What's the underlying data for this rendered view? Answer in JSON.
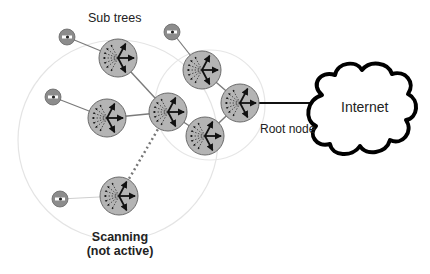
{
  "labels": {
    "subtrees": "Sub trees",
    "root_node": "Root node",
    "internet": "Internet",
    "scanning_line1": "Scanning",
    "scanning_line2": "(not active)"
  },
  "colors": {
    "node_fill": "#b4b4b4",
    "node_stroke": "#6a6a6a",
    "gateway_fill": "#8c8c8c",
    "link": "#7a7a7a",
    "coverage": "#e2e2e2",
    "arrow": "#111111",
    "cloud_stroke": "#000000"
  },
  "nodes": [
    {
      "id": "subtree-top",
      "role": "mesh-node"
    },
    {
      "id": "subtree-left",
      "role": "mesh-node"
    },
    {
      "id": "center",
      "role": "mesh-node"
    },
    {
      "id": "top-right",
      "role": "mesh-node"
    },
    {
      "id": "root",
      "role": "root-node"
    },
    {
      "id": "lower-right",
      "role": "mesh-node"
    },
    {
      "id": "scanning",
      "role": "scanning-node"
    }
  ],
  "gateways": [
    {
      "id": "gw-1",
      "attached_to": "subtree-top"
    },
    {
      "id": "gw-2",
      "attached_to": "top-right"
    },
    {
      "id": "gw-3",
      "attached_to": "subtree-left"
    },
    {
      "id": "gw-4",
      "attached_to": "scanning"
    }
  ],
  "links": [
    {
      "from": "subtree-top",
      "to": "center",
      "style": "solid"
    },
    {
      "from": "subtree-left",
      "to": "center",
      "style": "solid"
    },
    {
      "from": "top-right",
      "to": "root",
      "style": "solid"
    },
    {
      "from": "lower-right",
      "to": "root",
      "style": "solid"
    },
    {
      "from": "center",
      "to": "lower-right",
      "style": "solid"
    },
    {
      "from": "scanning",
      "to": "center",
      "style": "dotted"
    },
    {
      "from": "root",
      "to": "internet",
      "style": "solid-bold"
    }
  ]
}
